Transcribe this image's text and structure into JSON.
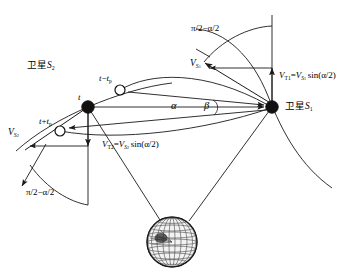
{
  "figure": {
    "type": "satellite-geometry-diagram",
    "background_color": "#ffffff",
    "line_color": "#1a1a1a",
    "width": 358,
    "height": 279
  },
  "labels": {
    "sat2_name_cjk": "卫星",
    "sat2_symbol": "S",
    "sat2_index": "2",
    "sat1_name_cjk": "卫星",
    "sat1_symbol": "S",
    "sat1_index": "1",
    "time_t": "t",
    "time_minus": "t",
    "time_minus_op": "−",
    "time_minus_sub": "t",
    "time_minus_subsub": "p",
    "time_plus": "t",
    "time_plus_op": "+",
    "time_plus_sub": "t",
    "time_plus_subsub": "p",
    "angle_alpha": "α",
    "angle_beta": "β",
    "arc_top": "π/2−α/2",
    "arc_bottom": "π/2−α/2",
    "v_s1_sym": "V",
    "v_s1_sub": "S",
    "v_s1_subsub": "1",
    "v_s2_sym": "V",
    "v_s2_sub": "S",
    "v_s2_subsub": "2",
    "vt1_sym": "V",
    "vt1_sub": "T1",
    "vt1_eq": "=",
    "vt1_rhs_sym": "V",
    "vt1_rhs_sub": "S",
    "vt1_rhs_subsub": "1",
    "vt1_fn": "sin(α/2)",
    "vt2_sym": "V",
    "vt2_sub": "T2",
    "vt2_eq": "=",
    "vt2_rhs_sym": "V",
    "vt2_rhs_sub": "S",
    "vt2_rhs_subsub": "2",
    "vt2_fn": "sin(α/2)"
  },
  "nodes": {
    "s1": {
      "x": 272,
      "y": 107,
      "marker": "filled-circle",
      "r": 6.2
    },
    "s2": {
      "x": 88,
      "y": 107,
      "marker": "filled-circle",
      "r": 6.2
    },
    "t_minus_tp": {
      "x": 120,
      "y": 90,
      "marker": "open-circle",
      "r": 5.2
    },
    "t_plus_tp": {
      "x": 60,
      "y": 131,
      "marker": "open-circle",
      "r": 5.2
    },
    "earth": {
      "x": 172,
      "y": 242,
      "marker": "wireframe-globe",
      "r": 25
    }
  }
}
